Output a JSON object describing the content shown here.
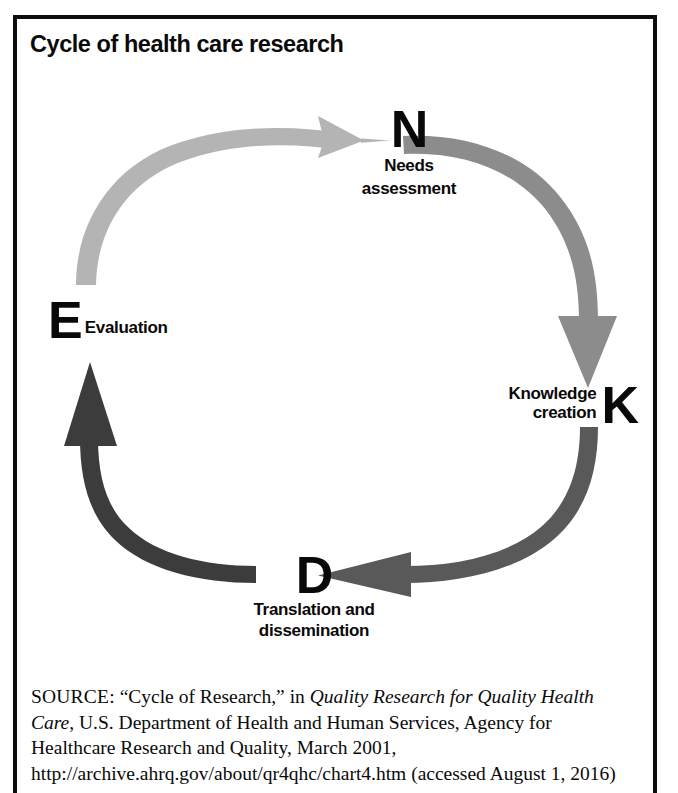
{
  "figure": {
    "title": "Cycle of health care research",
    "border_color": "#0d0d0d",
    "background": "#ffffff"
  },
  "diagram": {
    "type": "cycle",
    "direction": "clockwise",
    "nodes": [
      {
        "id": "n",
        "letter": "N",
        "caption": "Needs\nassessment",
        "caption_line1": "Needs",
        "caption_line2": "assessment",
        "position": "top"
      },
      {
        "id": "k",
        "letter": "K",
        "caption": "Knowledge\ncreation",
        "caption_line1": "Knowledge",
        "caption_line2": "creation",
        "position": "right"
      },
      {
        "id": "d",
        "letter": "D",
        "caption": "Translation and\ndissemination",
        "caption_line1": "Translation and",
        "caption_line2": "dissemination",
        "position": "bottom"
      },
      {
        "id": "e",
        "letter": "E",
        "caption": "Evaluation",
        "caption_line1": "Evaluation",
        "position": "left"
      }
    ],
    "arrows": [
      {
        "id": "e-to-n",
        "from": "E",
        "to": "N",
        "color": "#b4b4b4",
        "label": "Evaluation to Needs assessment"
      },
      {
        "id": "n-to-k",
        "from": "N",
        "to": "K",
        "color": "#8c8c8c",
        "label": "Needs assessment to Knowledge creation"
      },
      {
        "id": "k-to-d",
        "from": "K",
        "to": "D",
        "color": "#595959",
        "label": "Knowledge creation to Translation and dissemination"
      },
      {
        "id": "d-to-e",
        "from": "D",
        "to": "E",
        "color": "#3c3c3c",
        "label": "Translation and dissemination to Evaluation"
      }
    ]
  },
  "source": {
    "label": "SOURCE:",
    "text_before_italic": " “Cycle of Research,” in ",
    "italic_title": "Quality Research for Quality Health Care",
    "text_after_italic": ", U.S. Department of Health and Human Services, Agency for Healthcare Research and Quality, March 2001, http://archive.ahrq.gov/about/qr4qhc/chart4.htm (accessed August 1, 2016)",
    "full_text": "SOURCE: “Cycle of Research,” in Quality Research for Quality Health Care, U.S. Department of Health and Human Services, Agency for Healthcare Research and Quality, March 2001, http://archive.ahrq.gov/about/qr4qhc/chart4.htm (accessed August 1, 2016)"
  }
}
